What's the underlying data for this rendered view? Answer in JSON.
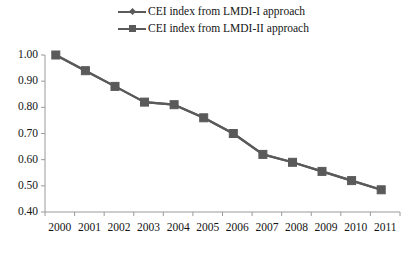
{
  "chart_data": {
    "type": "line",
    "title": "",
    "xlabel": "",
    "ylabel": "",
    "categories": [
      "2000",
      "2001",
      "2002",
      "2003",
      "2004",
      "2005",
      "2006",
      "2007",
      "2008",
      "2009",
      "2010",
      "2011"
    ],
    "series": [
      {
        "name": "CEI index from LMDI-I approach",
        "marker": "diamond",
        "color": "#5a5a5a",
        "values": [
          1.0,
          0.94,
          0.88,
          0.82,
          0.81,
          0.76,
          0.7,
          0.62,
          0.59,
          0.555,
          0.52,
          0.485
        ]
      },
      {
        "name": "CEI index from LMDI-II approach",
        "marker": "square",
        "color": "#5a5a5a",
        "values": [
          1.0,
          0.94,
          0.88,
          0.82,
          0.81,
          0.76,
          0.7,
          0.62,
          0.59,
          0.555,
          0.52,
          0.485
        ]
      }
    ],
    "ylim": [
      0.4,
      1.0
    ],
    "ytick_labels": [
      "1.00",
      "0.90",
      "0.80",
      "0.70",
      "0.60",
      "0.50",
      "0.40"
    ],
    "ytick_values": [
      1.0,
      0.9,
      0.8,
      0.7,
      0.6,
      0.5,
      0.4
    ],
    "grid": false,
    "legend_position": "top-center",
    "axis_color": "#9a9a9a"
  },
  "legend": {
    "items": [
      {
        "label": "CEI index from LMDI-I approach"
      },
      {
        "label": "CEI index from LMDI-II approach"
      }
    ]
  }
}
